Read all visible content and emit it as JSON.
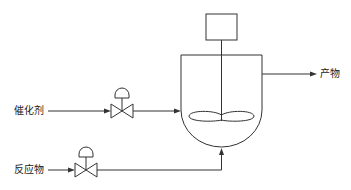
{
  "diagram": {
    "type": "stirred-tank-reactor-process-flow",
    "labels": {
      "catalyst": "催化剂",
      "reactant": "反应物",
      "product": "产物"
    },
    "components": {
      "motor": "agitator-motor-box",
      "vessel": "reactor-vessel",
      "agitator": "impeller",
      "catalyst_valve": "control-valve",
      "reactant_valve": "control-valve"
    },
    "colors": {
      "line": "#333333",
      "background": "#ffffff"
    }
  }
}
